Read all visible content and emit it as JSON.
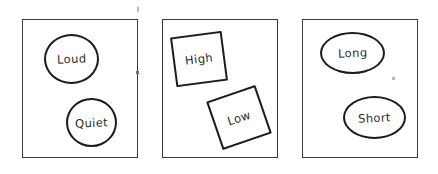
{
  "canvas": {
    "width": 438,
    "height": 174,
    "background": "#ffffff",
    "stroke_color": "#1c1c1c",
    "panel_stroke_color": "#3a3a3a",
    "text_color": "#2b2b2b"
  },
  "panels": [
    {
      "id": "panel-1",
      "shape_kind": "circle",
      "shapes": [
        {
          "label": "Loud",
          "kind": "circle"
        },
        {
          "label": "Quiet",
          "kind": "circle"
        }
      ]
    },
    {
      "id": "panel-2",
      "shape_kind": "square",
      "shapes": [
        {
          "label": "High",
          "kind": "square",
          "rotation_deg": -7.5
        },
        {
          "label": "Low",
          "kind": "square",
          "rotation_deg": -19
        }
      ]
    },
    {
      "id": "panel-3",
      "shape_kind": "ellipse",
      "shapes": [
        {
          "label": "Long",
          "kind": "ellipse"
        },
        {
          "label": "Short",
          "kind": "ellipse"
        }
      ]
    }
  ]
}
